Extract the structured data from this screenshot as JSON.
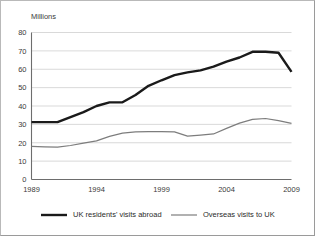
{
  "chart_data": {
    "type": "line",
    "title": "",
    "subtitle": "",
    "ylabel": "Millions",
    "xlabel": "",
    "ylim": [
      0,
      80
    ],
    "xlim": [
      1989,
      2009
    ],
    "y_ticks": [
      0,
      10,
      20,
      30,
      40,
      50,
      60,
      70,
      80
    ],
    "x_ticks": [
      1989,
      1994,
      1999,
      2004,
      2009
    ],
    "grid": "horizontal",
    "legend_position": "bottom",
    "x": [
      1989,
      1990,
      1991,
      1992,
      1993,
      1994,
      1995,
      1996,
      1997,
      1998,
      1999,
      2000,
      2001,
      2002,
      2003,
      2004,
      2005,
      2006,
      2007,
      2008,
      2009
    ],
    "series": [
      {
        "name": "UK residents' visits abroad",
        "color": "#1a1a1a",
        "width": 2.4,
        "values": [
          31.2,
          31.2,
          31.2,
          34.0,
          36.7,
          40.0,
          42.0,
          42.0,
          46.0,
          51.0,
          54.0,
          56.8,
          58.3,
          59.4,
          61.4,
          64.2,
          66.4,
          69.5,
          69.5,
          69.0,
          58.6
        ]
      },
      {
        "name": "Overseas visits to UK",
        "color": "#7d7d7d",
        "width": 1.2,
        "values": [
          18.0,
          17.8,
          17.6,
          18.5,
          19.8,
          21.0,
          23.5,
          25.2,
          25.9,
          26.0,
          26.0,
          25.9,
          23.6,
          24.2,
          24.8,
          27.8,
          30.7,
          32.7,
          33.2,
          32.0,
          30.5
        ]
      }
    ]
  },
  "legend": {
    "items": [
      {
        "label": "UK residents' visits abroad",
        "color": "#1a1a1a",
        "width": 2.4
      },
      {
        "label": "Overseas visits to UK",
        "color": "#7d7d7d",
        "width": 1.2
      }
    ]
  }
}
